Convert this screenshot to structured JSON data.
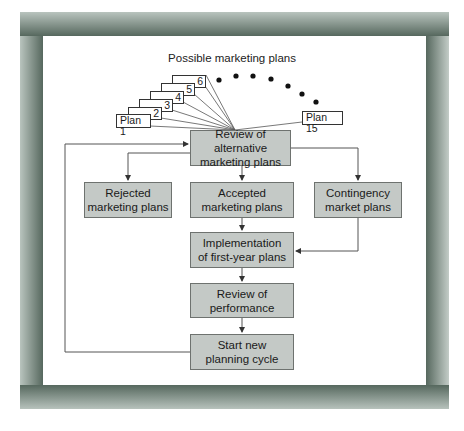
{
  "diagram": {
    "title": "Possible marketing plans",
    "plans": [
      {
        "label": "Plan 1"
      },
      {
        "label": "2"
      },
      {
        "label": "3"
      },
      {
        "label": "4"
      },
      {
        "label": "5"
      },
      {
        "label": "6"
      },
      {
        "label": "Plan 15"
      }
    ],
    "ellipsis_dots": 7,
    "nodes": {
      "review_alternative": "Review of alternative marketing plans",
      "review_alternative_line1": "Review of alternative",
      "review_alternative_line2": "marketing plans",
      "rejected_line1": "Rejected",
      "rejected_line2": "marketing plans",
      "accepted_line1": "Accepted",
      "accepted_line2": "marketing plans",
      "contingency_line1": "Contingency",
      "contingency_line2": "market plans",
      "implementation_line1": "Implementation",
      "implementation_line2": "of first-year plans",
      "performance_line1": "Review of",
      "performance_line2": "performance",
      "start_line1": "Start new",
      "start_line2": "planning cycle"
    },
    "colors": {
      "box_fill": "#c4c9c6",
      "box_border": "#6e726f",
      "frame": "#56685e",
      "line": "#555555"
    }
  }
}
